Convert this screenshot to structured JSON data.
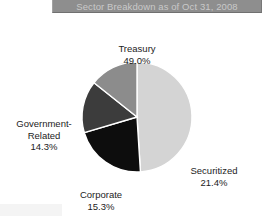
{
  "title": {
    "text": "Sector Breakdown as of Oct 31, 2008"
  },
  "colors": {
    "title_bar_background": "#8e8e8e",
    "title_bar_text": "#c9c9c9",
    "page_background": "#ffffff",
    "label_text": "#1c1c1c",
    "slice_border": "#ffffff"
  },
  "chart_data": {
    "type": "pie",
    "title": "Sector Breakdown as of Oct 31, 2008",
    "xlabel": "",
    "ylabel": "",
    "unit": "%",
    "start_angle_deg": 0,
    "direction": "clockwise",
    "legend": "none",
    "grid": false,
    "labels_inline": true,
    "categories": [
      "Treasury",
      "Securitized",
      "Corporate",
      "Government-Related"
    ],
    "values": [
      49.0,
      21.4,
      15.3,
      14.3
    ],
    "value_labels": [
      "49.0%",
      "21.4%",
      "15.3%",
      "14.3%"
    ],
    "slice_colors": [
      "#d4d4d4",
      "#0d0d0d",
      "#3c3c3c",
      "#8c8c8c"
    ],
    "slices": [
      {
        "name": "Treasury",
        "value": 49.0,
        "value_label": "49.0%",
        "color": "#d4d4d4",
        "label_position": "top"
      },
      {
        "name": "Securitized",
        "value": 21.4,
        "value_label": "21.4%",
        "color": "#0d0d0d",
        "label_position": "bottom-right"
      },
      {
        "name": "Corporate",
        "value": 15.3,
        "value_label": "15.3%",
        "color": "#3c3c3c",
        "label_position": "bottom"
      },
      {
        "name": "Government-Related",
        "value": 14.3,
        "value_label": "14.3%",
        "color": "#8c8c8c",
        "label_position": "left"
      }
    ]
  },
  "labels": {
    "treasury": {
      "name": "Treasury",
      "value": "49.0%"
    },
    "securitized": {
      "name": "Securitized",
      "value": "21.4%"
    },
    "corporate": {
      "name": "Corporate",
      "value": "15.3%"
    },
    "government_related": {
      "name_line1": "Government-",
      "name_line2": "Related",
      "value": "14.3%"
    }
  }
}
